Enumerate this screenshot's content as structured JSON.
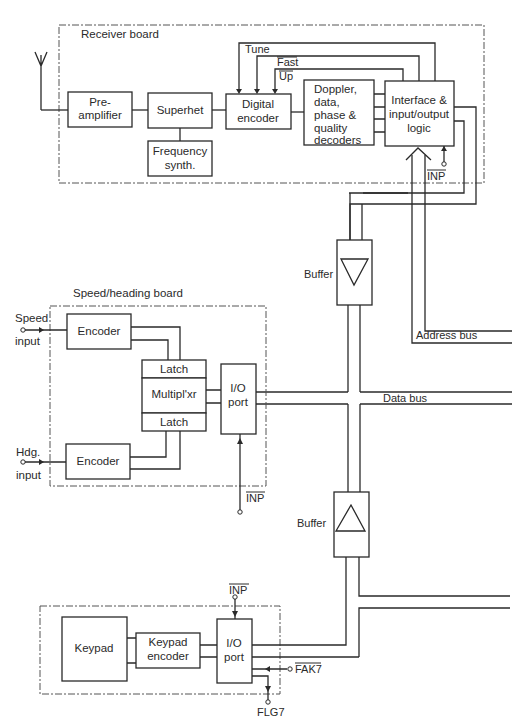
{
  "receiver_board": {
    "title": "Receiver board",
    "preamp": [
      "Pre-",
      "amplifier"
    ],
    "superhet": "Superhet",
    "freq_synth": [
      "Frequency",
      "synth."
    ],
    "digital_encoder": [
      "Digital",
      "encoder"
    ],
    "decoders": [
      "Doppler,",
      "data,",
      "phase &",
      "quality",
      "decoders"
    ],
    "interface": [
      "Interface &",
      "input/output",
      "logic"
    ],
    "signals": {
      "tune": "Tune",
      "fast": "Fast",
      "up": "Up",
      "inp": "INP"
    }
  },
  "speed_heading_board": {
    "title": "Speed/heading board",
    "speed_input": [
      "Speed",
      "input"
    ],
    "hdg_input": [
      "Hdg.",
      "input"
    ],
    "encoder_top": "Encoder",
    "encoder_bottom": "Encoder",
    "latch_top": "Latch",
    "multiplexer": "Multipl'xr",
    "latch_bottom": "Latch",
    "io_port": [
      "I/O",
      "port"
    ],
    "inp": "INP"
  },
  "buses": {
    "buffer_top": "Buffer",
    "buffer_bottom": "Buffer",
    "address_bus": "Address bus",
    "data_bus": "Data bus"
  },
  "keypad_board": {
    "keypad": "Keypad",
    "keypad_encoder": [
      "Keypad",
      "encoder"
    ],
    "io_port": [
      "I/O",
      "port"
    ],
    "inp": "INP",
    "fak7": "FAK7",
    "flg7": "FLG7"
  }
}
